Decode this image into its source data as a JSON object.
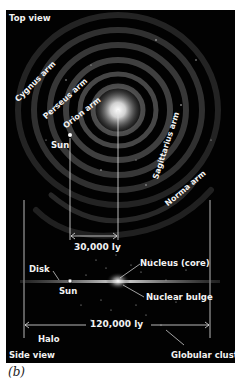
{
  "figure": {
    "caption": "(b)",
    "top_view": {
      "title": "Top view",
      "arms": [
        {
          "label": "Cygnus arm"
        },
        {
          "label": "Perseus arm"
        },
        {
          "label": "Orion arm"
        },
        {
          "label": "Sagittarius arm"
        },
        {
          "label": "Norma arm"
        }
      ],
      "sun_label": "Sun",
      "distance_label": "30,000 ly"
    },
    "side_view": {
      "title": "Side view",
      "disk_label": "Disk",
      "sun_label": "Sun",
      "nucleus_label": "Nucleus (core)",
      "bulge_label": "Nuclear bulge",
      "diameter_label": "120,000 ly",
      "halo_label": "Halo",
      "globular_cluster_label": "Globular cluster"
    },
    "colors": {
      "background": "#020202",
      "text": "#f2f2f2",
      "page": "#ffffff"
    }
  }
}
